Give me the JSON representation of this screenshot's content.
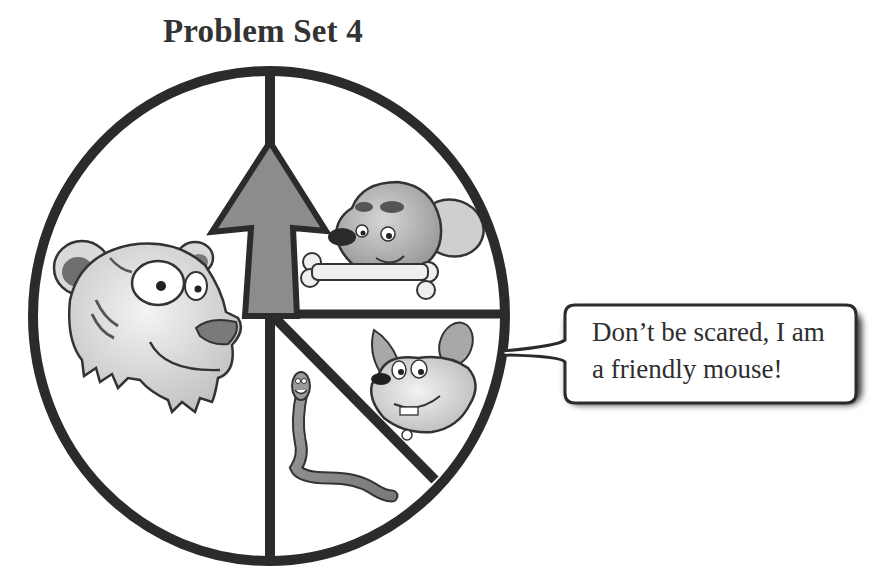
{
  "title": "Problem Set 4",
  "spinner": {
    "sections": [
      {
        "id": "tiger",
        "label": "tiger",
        "share": "1/2"
      },
      {
        "id": "dog",
        "label": "dog with bone",
        "share": "1/4"
      },
      {
        "id": "mouse",
        "label": "mouse",
        "share": "1/8"
      },
      {
        "id": "worm",
        "label": "worm",
        "share": "1/8"
      }
    ],
    "pointer": "arrow pointing up",
    "colors": {
      "outline": "#2b2b2b",
      "arrow_fill": "#8c8c8c",
      "background": "#ffffff"
    }
  },
  "speech_bubble": {
    "speaker": "mouse",
    "lines": [
      "Don’t be scared, I am",
      "a friendly mouse!"
    ]
  }
}
